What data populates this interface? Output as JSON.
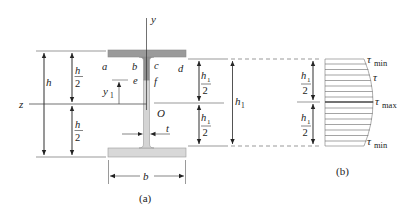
{
  "figure": {
    "panel_a": {
      "caption": "(a)",
      "axes": {
        "y_axis_label": "y",
        "z_axis_label": "z",
        "origin_label": "O"
      },
      "points": {
        "a": "a",
        "b": "b",
        "c": "c",
        "d": "d",
        "e": "e",
        "f": "f"
      },
      "dimensions": {
        "h": "h",
        "h_half_num": "h",
        "h_half_den": "2",
        "y1_main": "y",
        "y1_sub": "1",
        "t": "t",
        "b": "b",
        "h1_half_num": "h",
        "h1_half_num_sub": "1",
        "h1_half_den": "2",
        "h1_main": "h",
        "h1_sub": "1"
      }
    },
    "panel_b": {
      "caption": "(b)",
      "labels": {
        "tau": "τ",
        "min_sub": "min",
        "max_sub": "max"
      },
      "dimensions": {
        "h1_half_num": "h",
        "h1_half_num_sub": "1",
        "h1_half_den": "2"
      }
    },
    "colors": {
      "flange_top": "#9a9a9a",
      "web_upper": "#8f8f8f",
      "web_lower": "#d4d4d4",
      "flange_bottom": "#d8d8d8",
      "line": "#333333",
      "hatch": "#555555"
    }
  }
}
